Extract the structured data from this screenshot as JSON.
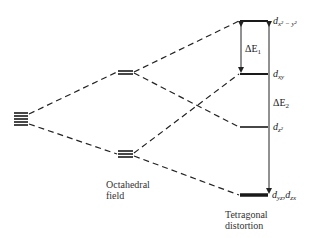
{
  "diagram": {
    "type": "energy-level-splitting",
    "stages": [
      {
        "id": "free-ion",
        "caption": [],
        "levels": [
          {
            "name": "d-orbitals-degenerate",
            "degeneracy": 5
          }
        ]
      },
      {
        "id": "octahedral",
        "caption": [
          "Octahedral",
          "field"
        ],
        "levels": [
          {
            "name": "eg",
            "degeneracy": 2
          },
          {
            "name": "t2g",
            "degeneracy": 3
          }
        ]
      },
      {
        "id": "tetragonal",
        "caption": [
          "Tetragonal",
          "distortion"
        ],
        "levels": [
          {
            "name": "d_x2-y2",
            "label_main": "d",
            "label_sub": "x² − y²"
          },
          {
            "name": "d_xy",
            "label_main": "d",
            "label_sub": "xy"
          },
          {
            "name": "d_z2",
            "label_main": "d",
            "label_sub": "z²"
          },
          {
            "name": "d_yz,d_zx",
            "label_main": "d",
            "label_sub": "yz",
            "label_main2": "d",
            "label_sub2": "zx"
          }
        ]
      }
    ],
    "gaps": [
      {
        "label": "ΔE",
        "sub": "1",
        "from": "d_xy",
        "to": "d_x2-y2"
      },
      {
        "label": "ΔE",
        "sub": "2",
        "from": "d_yz,d_zx",
        "to": "d_x2-y2"
      }
    ]
  }
}
